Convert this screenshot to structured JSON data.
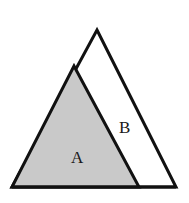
{
  "figure": {
    "canvas": {
      "width": 189,
      "height": 203,
      "background": "#ffffff"
    },
    "colors": {
      "stroke": "#111111",
      "shaded_fill": "#c9c9c9",
      "unshaded_fill": "#ffffff",
      "label_color": "#1a1a1a"
    },
    "stroke_width": 3,
    "outer_triangle": {
      "name": "outer-triangle",
      "points": "97,30 176,187 12,187",
      "fill": "#ffffff"
    },
    "shaded_triangle": {
      "name": "shaded-triangle-a",
      "points": "74,66 139,187 12,187",
      "fill": "#c9c9c9"
    },
    "base_line": {
      "name": "base-line",
      "x1": 12,
      "y1": 187,
      "x2": 176,
      "y2": 187
    },
    "labels": [
      {
        "id": "A",
        "text": "A",
        "x": 78,
        "y": 158,
        "region": "shaded"
      },
      {
        "id": "B",
        "text": "B",
        "x": 125,
        "y": 128,
        "region": "unshaded"
      }
    ]
  }
}
